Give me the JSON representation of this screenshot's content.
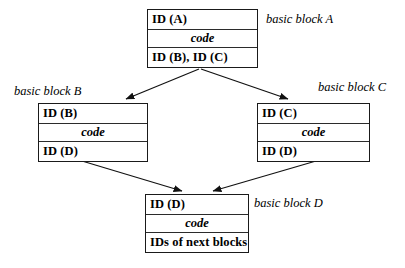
{
  "diagram": {
    "background_color": "#ffffff",
    "stroke_color": "#1a1a1a",
    "blocks": [
      {
        "key": "A",
        "label": "basic block A",
        "id_row": "ID (A)",
        "code_row": "code",
        "next_row": "ID (B), ID (C)"
      },
      {
        "key": "B",
        "label": "basic block B",
        "id_row": "ID (B)",
        "code_row": "code",
        "next_row": "ID (D)"
      },
      {
        "key": "C",
        "label": "basic block C",
        "id_row": "ID (C)",
        "code_row": "code",
        "next_row": "ID (D)"
      },
      {
        "key": "D",
        "label": "basic block D",
        "id_row": "ID (D)",
        "code_row": "code",
        "next_row": "IDs of next blocks"
      }
    ],
    "edges": [
      {
        "name": "edge-a-to-b",
        "from": "A",
        "to": "B"
      },
      {
        "name": "edge-a-to-c",
        "from": "A",
        "to": "C"
      },
      {
        "name": "edge-b-to-d",
        "from": "B",
        "to": "D"
      },
      {
        "name": "edge-c-to-d",
        "from": "C",
        "to": "D"
      }
    ]
  }
}
